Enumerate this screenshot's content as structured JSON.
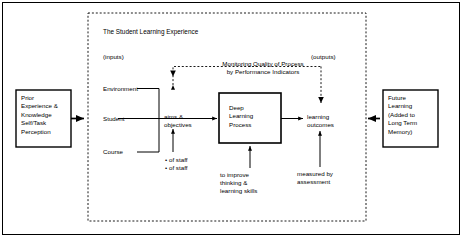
{
  "diagram": {
    "title": "The Student Learning Experience",
    "region_labels": {
      "inputs": "(inputs)",
      "outputs": "(outputs)"
    },
    "input_box": {
      "name": "prior-experience-box",
      "text": "Prior\nExperience &\nKnowledge\nSelf/Task\nPerception"
    },
    "output_box": {
      "name": "future-learning-box",
      "text": "Future\nLearning\n(Added to\nLong Term\nMemory)"
    },
    "process_box": {
      "name": "deep-learning-process-box",
      "text": "Deep\nLearning\nProcess"
    },
    "input_factors": [
      {
        "label": "Environment"
      },
      {
        "label": "Student"
      },
      {
        "label": "Course"
      }
    ],
    "aims_label": "aims &\nobjectives",
    "outcomes_label": "learning\noutcomes",
    "staff_notes": "• of staff\n• of staff",
    "improve_note": "to improve\nthinking &\nlearning skills",
    "measured_note": "measured by\nassessment",
    "feedback_label": "Monitoring Quality of Process\nby Performance Indicators",
    "colors": {
      "stroke": "#000000",
      "background": "#ffffff",
      "dashed": "#000000"
    }
  }
}
